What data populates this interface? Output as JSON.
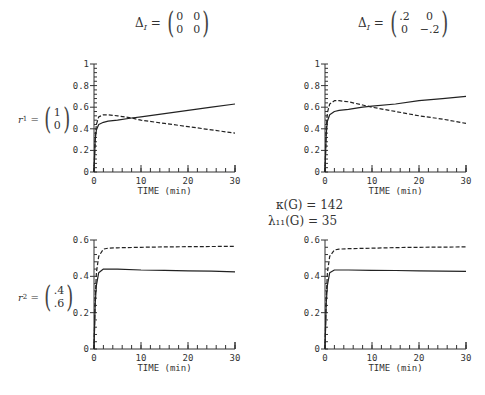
{
  "columns": [
    {
      "label_prefix": "Δ",
      "label_sub": "I",
      "matrix": [
        [
          "0",
          "0"
        ],
        [
          "0",
          "0"
        ]
      ]
    },
    {
      "label_prefix": "Δ",
      "label_sub": "I",
      "matrix": [
        [
          ".2",
          "0"
        ],
        [
          "0",
          "−.2"
        ]
      ]
    }
  ],
  "rows": [
    {
      "label_prefix": "r",
      "label_sub": "1",
      "vector": [
        "1",
        "0"
      ]
    },
    {
      "label_prefix": "r",
      "label_sub": "2",
      "vector": [
        ".4",
        ".6"
      ]
    }
  ],
  "center_note": {
    "line1": "κ(G) = 142",
    "line2": "λ₁₁(G) = 35"
  },
  "axis": {
    "xlabel": "TIME (min)",
    "xticks": [
      "0",
      "10",
      "20",
      "30"
    ]
  },
  "chart_data": [
    {
      "type": "line",
      "panel": "top-left",
      "row": "r1 = (1, 0)",
      "column": "ΔI = ((0,0),(0,0))",
      "xlabel": "TIME (min)",
      "ylabel": "",
      "xlim": [
        0,
        30
      ],
      "ylim": [
        0,
        1
      ],
      "yticks": [
        "0",
        "0.2",
        "0.4",
        "0.6",
        "0.8",
        "1"
      ],
      "grid": false,
      "x": [
        0,
        0.25,
        0.5,
        1,
        2,
        3,
        5,
        8,
        10,
        15,
        20,
        25,
        30
      ],
      "series": [
        {
          "name": "solid",
          "style": "solid",
          "values": [
            0,
            0.3,
            0.39,
            0.44,
            0.46,
            0.47,
            0.48,
            0.5,
            0.51,
            0.54,
            0.57,
            0.6,
            0.63
          ]
        },
        {
          "name": "dashed",
          "style": "dashed",
          "values": [
            0,
            0.32,
            0.44,
            0.51,
            0.53,
            0.53,
            0.52,
            0.5,
            0.48,
            0.45,
            0.42,
            0.39,
            0.36
          ]
        }
      ]
    },
    {
      "type": "line",
      "panel": "top-right",
      "row": "r1 = (1, 0)",
      "column": "ΔI = ((.2,0),(0,-.2))",
      "xlabel": "TIME (min)",
      "ylabel": "",
      "xlim": [
        0,
        30
      ],
      "ylim": [
        0,
        1
      ],
      "yticks": [
        "0",
        "0.2",
        "0.4",
        "0.6",
        "0.8",
        "1"
      ],
      "grid": false,
      "x": [
        0,
        0.25,
        0.5,
        1,
        2,
        3,
        5,
        8,
        10,
        15,
        20,
        25,
        30
      ],
      "series": [
        {
          "name": "solid",
          "style": "solid",
          "values": [
            0,
            0.35,
            0.47,
            0.53,
            0.56,
            0.57,
            0.58,
            0.6,
            0.61,
            0.63,
            0.66,
            0.68,
            0.7
          ]
        },
        {
          "name": "dashed",
          "style": "dashed",
          "values": [
            0,
            0.4,
            0.55,
            0.63,
            0.66,
            0.66,
            0.65,
            0.62,
            0.6,
            0.56,
            0.52,
            0.49,
            0.45
          ]
        }
      ]
    },
    {
      "type": "line",
      "panel": "bottom-left",
      "row": "r2 = (.4, .6)",
      "column": "ΔI = ((0,0),(0,0))",
      "xlabel": "TIME (min)",
      "ylabel": "",
      "xlim": [
        0,
        30
      ],
      "ylim": [
        0,
        0.6
      ],
      "yticks": [
        "0",
        "0.2",
        "0.4",
        "0.6"
      ],
      "grid": false,
      "x": [
        0,
        0.25,
        0.5,
        1,
        2,
        3,
        5,
        10,
        15,
        20,
        25,
        30
      ],
      "series": [
        {
          "name": "solid",
          "style": "solid",
          "values": [
            0,
            0.25,
            0.35,
            0.42,
            0.44,
            0.44,
            0.44,
            0.435,
            0.433,
            0.43,
            0.428,
            0.425
          ]
        },
        {
          "name": "dashed",
          "style": "dashed",
          "values": [
            0,
            0.28,
            0.42,
            0.51,
            0.55,
            0.555,
            0.557,
            0.56,
            0.562,
            0.563,
            0.564,
            0.565
          ]
        }
      ]
    },
    {
      "type": "line",
      "panel": "bottom-right",
      "row": "r2 = (.4, .6)",
      "column": "ΔI = ((.2,0),(0,-.2))",
      "xlabel": "TIME (min)",
      "ylabel": "",
      "xlim": [
        0,
        30
      ],
      "ylim": [
        0,
        0.6
      ],
      "yticks": [
        "0",
        "0.2",
        "0.4",
        "0.6"
      ],
      "grid": false,
      "x": [
        0,
        0.25,
        0.5,
        1,
        2,
        3,
        5,
        10,
        15,
        20,
        25,
        30
      ],
      "series": [
        {
          "name": "solid",
          "style": "solid",
          "values": [
            0,
            0.25,
            0.35,
            0.42,
            0.435,
            0.435,
            0.435,
            0.433,
            0.432,
            0.43,
            0.428,
            0.427
          ]
        },
        {
          "name": "dashed",
          "style": "dashed",
          "values": [
            0,
            0.28,
            0.42,
            0.51,
            0.545,
            0.55,
            0.552,
            0.555,
            0.558,
            0.56,
            0.561,
            0.562
          ]
        }
      ]
    }
  ]
}
